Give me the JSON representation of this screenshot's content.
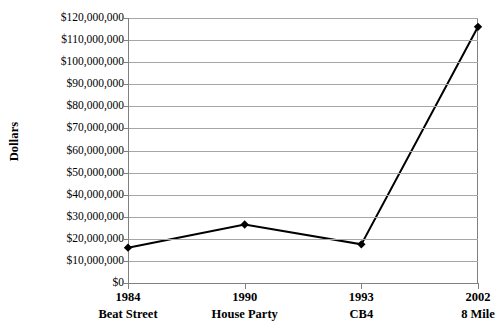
{
  "chart_data": {
    "type": "line",
    "title": "",
    "xlabel": "",
    "ylabel": "Dollars",
    "categories": [
      "1984",
      "1990",
      "1993",
      "2002"
    ],
    "category_names": [
      "Beat Street",
      "House Party",
      "CB4",
      "8 Mile"
    ],
    "values": [
      16000000,
      26500000,
      17500000,
      116000000
    ],
    "ylim": [
      0,
      120000000
    ],
    "ytick_values": [
      0,
      10000000,
      20000000,
      30000000,
      40000000,
      50000000,
      60000000,
      70000000,
      80000000,
      90000000,
      100000000,
      110000000,
      120000000
    ],
    "ytick_labels": [
      "$0",
      "$10,000,000",
      "$20,000,000",
      "$30,000,000",
      "$40,000,000",
      "$50,000,000",
      "$60,000,000",
      "$70,000,000",
      "$80,000,000",
      "$90,000,000",
      "$100,000,000",
      "$110,000,000",
      "$120,000,000"
    ],
    "grid": true,
    "legend": false,
    "legend_position": "none",
    "series": [
      {
        "name": "Dollars",
        "values": [
          16000000,
          26500000,
          17500000,
          116000000
        ],
        "marker": "diamond",
        "line_color": "#000000",
        "marker_color": "#000000"
      }
    ],
    "colors": {
      "background": "#ffffff",
      "gridline": "#a6a6a6",
      "axis": "#808080",
      "line": "#000000",
      "marker": "#000000",
      "text": "#000000"
    }
  }
}
